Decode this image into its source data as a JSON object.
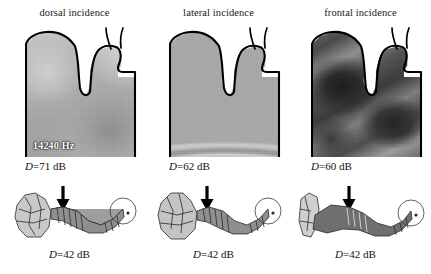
{
  "figure": {
    "panels": [
      {
        "heading": "dorsal incidence",
        "frequency": "14240 Hz",
        "directivity_top": "D=71 dB",
        "directivity_bottom": "D=42 dB",
        "arrow_icon": "down-arrow-icon",
        "field_style": "light smooth gradient"
      },
      {
        "heading": "lateral incidence",
        "frequency": "",
        "directivity_top": "D=62 dB",
        "directivity_bottom": "D=42 dB",
        "arrow_icon": "down-arrow-icon",
        "field_style": "horizontal arc fringes"
      },
      {
        "heading": "frontal incidence",
        "frequency": "",
        "directivity_top": "D=60 dB",
        "directivity_bottom": "D=42 dB",
        "arrow_icon": "down-arrow-icon",
        "field_style": "dark diagonal lobes"
      }
    ],
    "labels": {
      "d_symbol": "D",
      "unit": "dB"
    },
    "colors": {
      "background": "#ffffff",
      "outline": "#000000",
      "text": "#111111",
      "freq_text": "#ffffff"
    }
  }
}
